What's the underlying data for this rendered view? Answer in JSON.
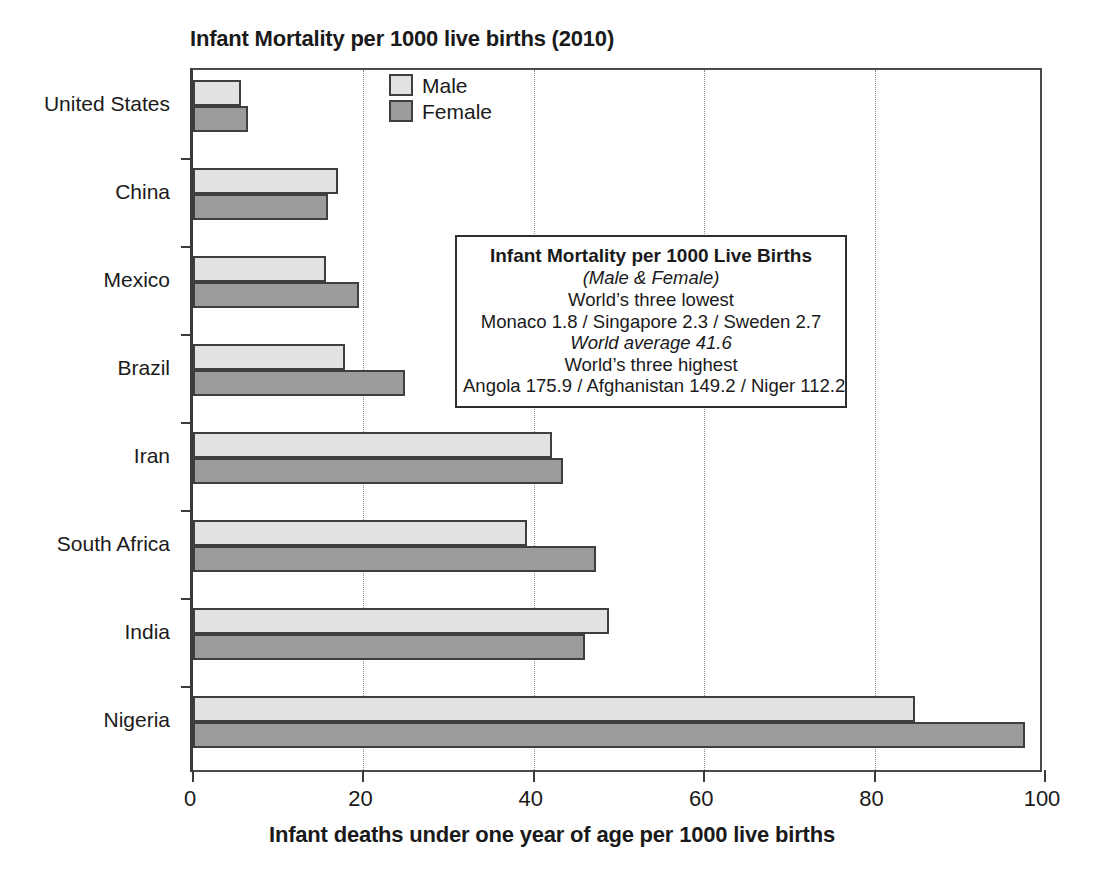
{
  "chart_data": {
    "type": "bar",
    "orientation": "horizontal",
    "title": "Infant Mortality per 1000 live births (2010)",
    "xlabel": "Infant deaths under one year of age per 1000 live births",
    "ylabel": "",
    "categories": [
      "United States",
      "China",
      "Mexico",
      "Brazil",
      "Iran",
      "South Africa",
      "India",
      "Nigeria"
    ],
    "series": [
      {
        "name": "Male",
        "color": "#e2e2e2",
        "values": [
          5.6,
          17.0,
          15.6,
          17.8,
          42.1,
          39.2,
          48.8,
          84.7
        ]
      },
      {
        "name": "Female",
        "color": "#9b9b9b",
        "values": [
          6.5,
          15.8,
          19.5,
          24.9,
          43.4,
          47.3,
          46.0,
          97.6
        ]
      }
    ],
    "xlim": [
      0,
      100
    ],
    "xticks": [
      0,
      20,
      40,
      60,
      80,
      100
    ],
    "xtick_labels": [
      "0",
      "20",
      "40",
      "60",
      "80",
      "100"
    ],
    "grid": "vertical-dotted",
    "legend_position": "top-center-left",
    "annotations": [
      {
        "name": "statistics-box",
        "lines": [
          {
            "text": "Infant Mortality per 1000 Live Births",
            "style": "bold"
          },
          {
            "text": "(Male & Female)",
            "style": "italic"
          },
          {
            "text": "World’s three lowest",
            "style": "normal"
          },
          {
            "text": "Monaco 1.8 / Singapore 2.3 / Sweden 2.7",
            "style": "normal"
          },
          {
            "text": "World average 41.6",
            "style": "italic"
          },
          {
            "text": "World’s three highest",
            "style": "normal"
          },
          {
            "text": "Angola 175.9 / Afghanistan 149.2 / Niger 112.2",
            "style": "normal"
          }
        ]
      }
    ]
  },
  "legend": {
    "items": [
      {
        "label": "Male",
        "color": "#e2e2e2"
      },
      {
        "label": "Female",
        "color": "#9b9b9b"
      }
    ]
  },
  "colors": {
    "male_fill": "#e2e2e2",
    "female_fill": "#9b9b9b",
    "bar_stroke": "#3f3f3f",
    "axis": "#3b3b3b",
    "grid": "#8d8d8d",
    "text": "#1a1a1a",
    "background": "#ffffff"
  }
}
